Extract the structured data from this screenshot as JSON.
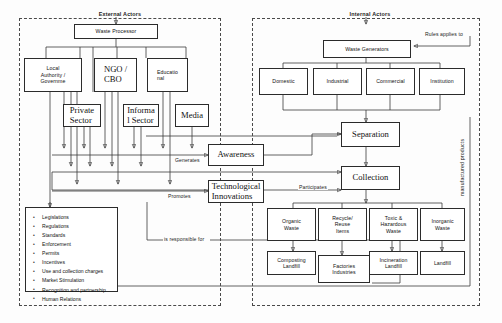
{
  "diagram": {
    "groups": [
      {
        "name": "external",
        "label": "External Actors"
      },
      {
        "name": "internal",
        "label": "Internal Actors"
      }
    ],
    "external_nodes": {
      "waste_processor": "Waste Processor",
      "local_authority": "Local\nAuthority /\nGovernme",
      "ngo_cbo": "NGO /\nCBO",
      "educational": "Educatio\nnal",
      "private_sector": "Private\nSector",
      "informal_sector": "Informa\nl Sector",
      "media": "Media",
      "policy_list_items": [
        "Legislations",
        "Regulations",
        "Standards",
        "Enforcement",
        "Permits",
        "Incentives",
        "Use and collection charges",
        "Market Stimulation",
        "Recognition and partnership",
        "Human Relations"
      ]
    },
    "center_nodes": {
      "awareness": "Awareness",
      "technological_innovations": "Technological\nInnovations"
    },
    "internal_nodes": {
      "waste_generators": "Waste Generators",
      "generator_types": [
        "Domestic",
        "Industrial",
        "Commercial",
        "Institution"
      ],
      "separation": "Separation",
      "collection": "Collection",
      "waste_streams": [
        "Organic\nWaste",
        "Recycle/\nReuse\nItems",
        "Toxic &\nHazardous\nWaste",
        "Inorganic\nWaste"
      ],
      "treatments": [
        "Composting\nLandfill",
        "Factories\nIndustries",
        "Incineration\nLandfill",
        "Landfill"
      ]
    },
    "edge_labels": {
      "generates": "Generates",
      "participates": "Participates",
      "promotes": "Promotes",
      "is_responsible_for": "is responsible for",
      "rules_applies_to": "Rules applies to",
      "manufactured_products": "manufactured products"
    },
    "colors": {
      "stroke": "#3a3a3a",
      "node_border": "#2b2b2b",
      "background": "#fdfdfd",
      "text": "#111111"
    }
  }
}
